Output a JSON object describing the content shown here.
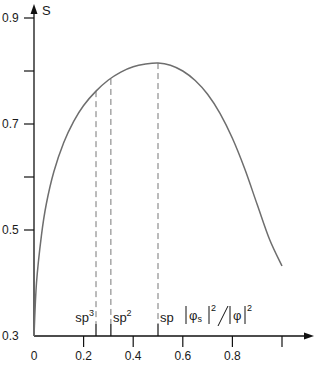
{
  "chart_data": {
    "type": "line",
    "title": "",
    "xlabel": "|φs|²/|φ|²",
    "ylabel": "S",
    "xlim": [
      0,
      1.0
    ],
    "ylim": [
      0.3,
      0.9
    ],
    "grid": false,
    "legend": null,
    "x_ticks": [
      {
        "value": 0,
        "label": "0"
      },
      {
        "value": 0.2,
        "label": "0.2"
      },
      {
        "value": 0.4,
        "label": "0.4"
      },
      {
        "value": 0.6,
        "label": "0.6"
      },
      {
        "value": 0.8,
        "label": "0.8"
      },
      {
        "value": 1.0,
        "label": ""
      }
    ],
    "y_ticks": [
      {
        "value": 0.3,
        "label": "0.3"
      },
      {
        "value": 0.5,
        "label": "0.5"
      },
      {
        "value": 0.6,
        "label": ""
      },
      {
        "value": 0.7,
        "label": "0.7"
      },
      {
        "value": 0.8,
        "label": ""
      },
      {
        "value": 0.9,
        "label": "0.9"
      }
    ],
    "series": [
      {
        "name": "S",
        "color": "#6e6e6e",
        "x": [
          0,
          0.01,
          0.03,
          0.05,
          0.08,
          0.12,
          0.16,
          0.2,
          0.25,
          0.3,
          0.35,
          0.4,
          0.45,
          0.5,
          0.55,
          0.6,
          0.65,
          0.7,
          0.75,
          0.8,
          0.85,
          0.9,
          0.95,
          1.0
        ],
        "values": [
          0.3,
          0.4,
          0.49,
          0.55,
          0.61,
          0.665,
          0.705,
          0.735,
          0.762,
          0.783,
          0.798,
          0.808,
          0.813,
          0.815,
          0.811,
          0.8,
          0.782,
          0.756,
          0.72,
          0.673,
          0.615,
          0.548,
          0.482,
          0.432
        ]
      }
    ],
    "annotations": [
      {
        "label": "sp3",
        "base": "sp",
        "sup": "3",
        "x": 0.25,
        "y": 0.762,
        "style": "dashed-vertical"
      },
      {
        "label": "sp2",
        "base": "sp",
        "sup": "2",
        "x": 0.31,
        "y": 0.785,
        "style": "dashed-vertical"
      },
      {
        "label": "sp",
        "base": "sp",
        "sup": "",
        "x": 0.5,
        "y": 0.815,
        "style": "dashed-vertical"
      }
    ]
  },
  "labels": {
    "y_axis_title": "S",
    "x_axis_title_parts": {
      "phi": "φ",
      "sub": "s",
      "sup": "2"
    }
  }
}
